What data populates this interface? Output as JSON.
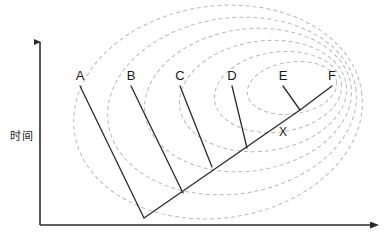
{
  "figure": {
    "type": "phylogenetic-tree-on-contour-map",
    "background_color": "#ffffff",
    "width": 385,
    "height": 245
  },
  "axes": {
    "color": "#2b2b2b",
    "y_axis": {
      "label": "时间",
      "label_x": 22,
      "label_y": 140,
      "x": 40,
      "y_top": 42,
      "y_bottom": 225,
      "arrow": "up"
    },
    "x_axis": {
      "label": "",
      "y": 225,
      "x_left": 40,
      "x_right": 370,
      "arrow": "right"
    }
  },
  "tree": {
    "line_color": "#2b2b2b",
    "line_width": 1.3,
    "taxa": [
      {
        "name": "A",
        "label_x": 80,
        "label_y": 80,
        "tip_x": 80,
        "tip_y": 86,
        "join_x": 144,
        "join_y": 218
      },
      {
        "name": "B",
        "label_x": 131,
        "label_y": 80,
        "tip_x": 131,
        "tip_y": 86,
        "join_x": 183,
        "join_y": 193
      },
      {
        "name": "C",
        "label_x": 180,
        "label_y": 80,
        "tip_x": 180,
        "tip_y": 86,
        "join_x": 212,
        "join_y": 167
      },
      {
        "name": "D",
        "label_x": 232,
        "label_y": 80,
        "tip_x": 232,
        "tip_y": 86,
        "join_x": 247,
        "join_y": 148
      },
      {
        "name": "E",
        "label_x": 283,
        "label_y": 80,
        "tip_x": 283,
        "tip_y": 86,
        "join_x": 300,
        "join_y": 110
      },
      {
        "name": "F",
        "label_x": 332,
        "label_y": 80,
        "tip_x": 332,
        "tip_y": 86,
        "join_x": 300,
        "join_y": 110
      }
    ],
    "internal_nodes": [
      {
        "name": "X",
        "label": "X",
        "label_x": 283,
        "label_y": 136,
        "x": 277,
        "y": 127
      }
    ],
    "backbone": {
      "x1": 144,
      "y1": 218,
      "x2": 300,
      "y2": 110
    }
  },
  "contours": {
    "style": "dashed",
    "color": "#b9b9b9",
    "line_width": 1,
    "dash_pattern": "4 3",
    "count": 6,
    "description": "nested fitness-landscape contour ovals",
    "rings": [
      {
        "cx": 218,
        "cy": 112,
        "rx": 145,
        "ry": 106,
        "rot": -8
      },
      {
        "cx": 232,
        "cy": 106,
        "rx": 125,
        "ry": 88,
        "rot": -8
      },
      {
        "cx": 248,
        "cy": 100,
        "rx": 104,
        "ry": 71,
        "rot": -8
      },
      {
        "cx": 263,
        "cy": 96,
        "rx": 84,
        "ry": 55,
        "rot": -8
      },
      {
        "cx": 278,
        "cy": 92,
        "rx": 64,
        "ry": 40,
        "rot": -8
      },
      {
        "cx": 292,
        "cy": 88,
        "rx": 45,
        "ry": 26,
        "rot": -8
      }
    ]
  }
}
